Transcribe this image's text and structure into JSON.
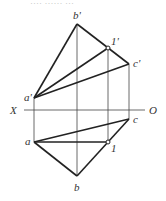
{
  "header_faint_text": "···· ······ ···",
  "axis": {
    "left_label": "X",
    "right_label": "O",
    "y": 110,
    "x1": 24,
    "x2": 145
  },
  "points": {
    "a_prime": {
      "label": "a'",
      "x": 34,
      "y": 98
    },
    "b_prime": {
      "label": "b'",
      "x": 77,
      "y": 24
    },
    "one_prime": {
      "label": "1'",
      "x": 108,
      "y": 48
    },
    "c_prime": {
      "label": "c'",
      "x": 129,
      "y": 64
    },
    "a": {
      "label": "a",
      "x": 34,
      "y": 142
    },
    "b": {
      "label": "b",
      "x": 77,
      "y": 176
    },
    "one": {
      "label": "1",
      "x": 108,
      "y": 142
    },
    "c": {
      "label": "c",
      "x": 129,
      "y": 119
    }
  },
  "colors": {
    "line": "#222222",
    "projector": "#444444",
    "label": "#333333"
  }
}
